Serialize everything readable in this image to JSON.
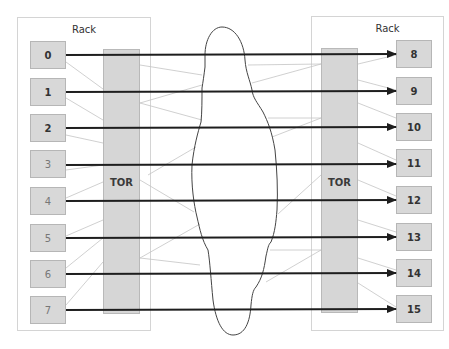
{
  "diagram": {
    "left_rack": {
      "label": "Rack",
      "tor_label": "TOR",
      "nodes": [
        "0",
        "1",
        "2",
        "3",
        "4",
        "5",
        "6",
        "7"
      ]
    },
    "right_rack": {
      "label": "Rack",
      "tor_label": "TOR",
      "nodes": [
        "8",
        "9",
        "10",
        "11",
        "12",
        "13",
        "14",
        "15"
      ]
    },
    "connections": [
      {
        "from": "0",
        "to": "8"
      },
      {
        "from": "1",
        "to": "9"
      },
      {
        "from": "2",
        "to": "10"
      },
      {
        "from": "3",
        "to": "11"
      },
      {
        "from": "4",
        "to": "12"
      },
      {
        "from": "5",
        "to": "13"
      },
      {
        "from": "6",
        "to": "14"
      },
      {
        "from": "7",
        "to": "15"
      }
    ],
    "network_cloud": "cloud-icon",
    "colors": {
      "node_fill": "#d8d8d8",
      "tor_fill": "#d6d6d6",
      "arrow": "#1e1e1e",
      "thin_link": "#bdbdbd",
      "cloud_outline": "#444444"
    }
  }
}
